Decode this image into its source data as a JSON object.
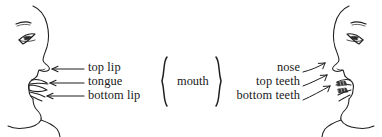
{
  "figure": {
    "type": "anatomical-line-drawing",
    "background_color": "#ffffff",
    "ink_color": "#1a1a1a",
    "width": 382,
    "height": 137
  },
  "left_face": {
    "name": "left-head-profile",
    "facing": "right",
    "features": [
      "forehead",
      "eyebrow",
      "eye",
      "nose",
      "top lip",
      "tongue",
      "bottom lip",
      "chin",
      "neck"
    ]
  },
  "right_face": {
    "name": "right-head-profile",
    "facing": "left",
    "features": [
      "forehead",
      "eyebrow",
      "eye",
      "nose",
      "top teeth",
      "bottom teeth",
      "lips",
      "chin",
      "neck"
    ]
  },
  "left_labels": {
    "items": [
      {
        "text": "top lip",
        "arrow": "left-arrow-icon"
      },
      {
        "text": "tongue",
        "arrow": "left-arrow-icon"
      },
      {
        "text": "bottom lip",
        "arrow": "left-arrow-icon"
      }
    ]
  },
  "right_labels": {
    "items": [
      {
        "text": "nose",
        "arrow": "diagonal-arrow-icon"
      },
      {
        "text": "top teeth",
        "arrow": "diagonal-arrow-icon"
      },
      {
        "text": "bottom teeth",
        "arrow": "diagonal-arrow-icon"
      }
    ]
  },
  "center": {
    "word": "mouth",
    "left_brace": "{",
    "right_brace": "}"
  }
}
